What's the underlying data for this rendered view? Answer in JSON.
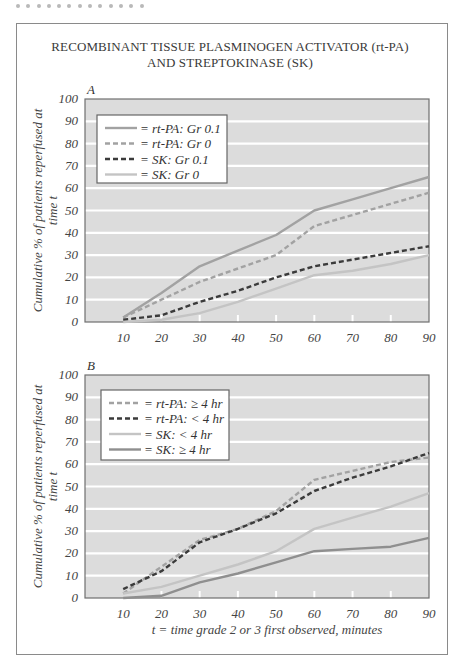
{
  "header": {
    "dots_count": 13,
    "title_line1": "RECOMBINANT TISSUE PLASMINOGEN ACTIVATOR (rt-PA)",
    "title_line2": "AND STREPTOKINASE (SK)"
  },
  "colors": {
    "plot_bg": "#dcdcdc",
    "grid": "#ffffff",
    "medium_grey": "#a2a2a2",
    "dark": "#3b3b3b",
    "light_grey": "#c4c4c4",
    "mid_dark_grey": "#8f8f8f"
  },
  "chart_data": [
    {
      "type": "line",
      "panel": "A",
      "title": "RECOMBINANT TISSUE PLASMINOGEN ACTIVATOR (rt-PA) AND STREPTOKINASE (SK)",
      "xlabel": "",
      "ylabel": "Cumulative % of patients reperfused at time t",
      "x": [
        10,
        20,
        30,
        40,
        50,
        60,
        70,
        80,
        90
      ],
      "xlim": [
        0,
        90
      ],
      "ylim": [
        0,
        100
      ],
      "yticks": [
        0,
        10,
        20,
        30,
        40,
        50,
        60,
        70,
        80,
        90,
        100
      ],
      "grid": "horizontal white lines",
      "legend_position": "upper left",
      "series": [
        {
          "name": "= rt-PA: Gr 0.1",
          "style": "solid",
          "color": "#a2a2a2",
          "values": [
            2,
            13,
            25,
            32,
            39,
            50,
            55,
            60,
            65
          ]
        },
        {
          "name": "= rt-PA: Gr 0",
          "style": "dashed",
          "color": "#a2a2a2",
          "values": [
            2,
            10,
            18,
            24,
            30,
            43,
            48,
            53,
            58
          ]
        },
        {
          "name": "= SK: Gr 0.1",
          "style": "dashed",
          "color": "#3b3b3b",
          "values": [
            1,
            3,
            9,
            14,
            20,
            25,
            28,
            31,
            34
          ]
        },
        {
          "name": "= SK: Gr 0",
          "style": "solid",
          "color": "#c4c4c4",
          "values": [
            0,
            1,
            4,
            9,
            15,
            21,
            23,
            26,
            30
          ]
        }
      ]
    },
    {
      "type": "line",
      "panel": "B",
      "xlabel": "t = time grade 2 or 3 first observed, minutes",
      "ylabel": "Cumulative % of patients reperfused at time t",
      "x": [
        10,
        20,
        30,
        40,
        50,
        60,
        70,
        80,
        90
      ],
      "xlim": [
        0,
        90
      ],
      "ylim": [
        0,
        100
      ],
      "yticks": [
        0,
        10,
        20,
        30,
        40,
        50,
        60,
        70,
        80,
        90,
        100
      ],
      "grid": "horizontal white lines",
      "legend_position": "upper left",
      "series": [
        {
          "name": "= rt-PA: ≥ 4 hr",
          "style": "dashed",
          "color": "#a2a2a2",
          "values": [
            2,
            14,
            26,
            31,
            39,
            53,
            57,
            61,
            63
          ]
        },
        {
          "name": "= rt-PA: < 4 hr",
          "style": "dashed",
          "color": "#3b3b3b",
          "values": [
            4,
            12,
            25,
            31,
            38,
            48,
            54,
            59,
            65
          ]
        },
        {
          "name": "= SK: < 4 hr",
          "style": "solid",
          "color": "#c4c4c4",
          "values": [
            2,
            5,
            10,
            15,
            21,
            31,
            36,
            41,
            47
          ]
        },
        {
          "name": "= SK: ≥ 4 hr",
          "style": "solid",
          "color": "#8f8f8f",
          "values": [
            0,
            1,
            7,
            11,
            16,
            21,
            22,
            23,
            27
          ]
        }
      ]
    }
  ]
}
